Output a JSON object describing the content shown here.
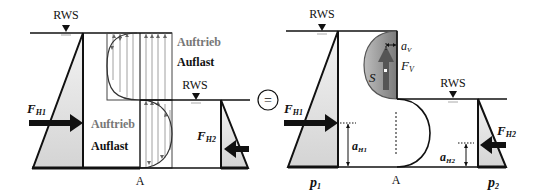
{
  "figure": {
    "title": "",
    "operator_symbol": "=",
    "left_panel": {
      "water_level_upper": "RWS",
      "water_level_lower": "RWS",
      "force_left": {
        "symbol": "F",
        "subscript": "H1"
      },
      "force_right": {
        "symbol": "F",
        "subscript": "H2"
      },
      "upper_labels": {
        "buoyancy": "Auftrieb",
        "load": "Auflast"
      },
      "lower_labels": {
        "buoyancy": "Auftrieb",
        "load": "Auflast"
      },
      "pivot_point": "A"
    },
    "right_panel": {
      "water_level_upper": "RWS",
      "water_level_lower": "RWS",
      "force_left": {
        "symbol": "F",
        "subscript": "H1"
      },
      "force_right": {
        "symbol": "F",
        "subscript": "H2"
      },
      "vertical_force": {
        "symbol": "F",
        "subscript": "V"
      },
      "centroid": "S",
      "arm_vertical": {
        "symbol": "a",
        "subscript": "V"
      },
      "arm_h1": {
        "symbol": "a",
        "subscript": "H1"
      },
      "arm_h2": {
        "symbol": "a",
        "subscript": "H2"
      },
      "pressure_left": {
        "symbol": "p",
        "subscript": "1"
      },
      "pressure_right": {
        "symbol": "p",
        "subscript": "2"
      },
      "pivot_point": "A"
    }
  },
  "colors": {
    "line": "#111111",
    "fill_light": "#d9d9d9",
    "fill_dark": "#8a8a8a",
    "label_grey": "#777777",
    "hatch": "#888888"
  }
}
